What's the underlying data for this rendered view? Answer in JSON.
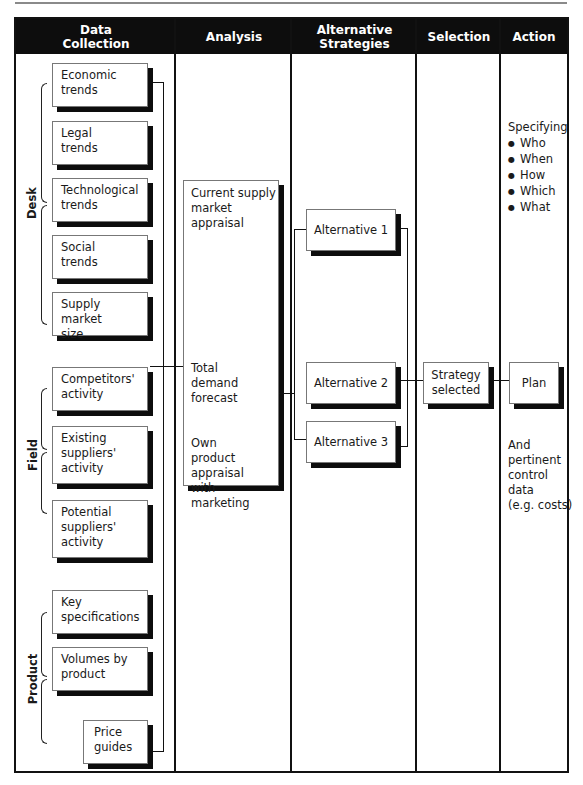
{
  "columns": [
    {
      "label": "Data\nCollection"
    },
    {
      "label": "Analysis"
    },
    {
      "label": "Alternative\nStrategies"
    },
    {
      "label": "Selection"
    },
    {
      "label": "Action"
    }
  ],
  "groups": {
    "desk": "Desk",
    "field": "Field",
    "product": "Product"
  },
  "data_collection": {
    "desk": [
      "Economic\ntrends",
      "Legal\ntrends",
      "Technological\ntrends",
      "Social\ntrends",
      "Supply market\nsize"
    ],
    "field": [
      "Competitors'\nactivity",
      "Existing\nsuppliers'\nactivity",
      "Potential\nsuppliers'\nactivity"
    ],
    "product": [
      "Key\nspecifications",
      "Volumes by\nproduct",
      "Price\nguides"
    ]
  },
  "analysis": {
    "items": [
      "Current supply\nmarket\nappraisal",
      "Total\ndemand\nforecast",
      "Own\nproduct\nappraisal\nwith\nmarketing"
    ]
  },
  "alternatives": [
    "Alternative 1",
    "Alternative 2",
    "Alternative 3"
  ],
  "selection": {
    "box": "Strategy\nselected"
  },
  "action": {
    "heading": "Specifying",
    "bullets": [
      "Who",
      "When",
      "How",
      "Which",
      "What"
    ],
    "plan": "Plan",
    "footer_note": "And\npertinent\ncontrol\ndata\n(e.g. costs)"
  }
}
